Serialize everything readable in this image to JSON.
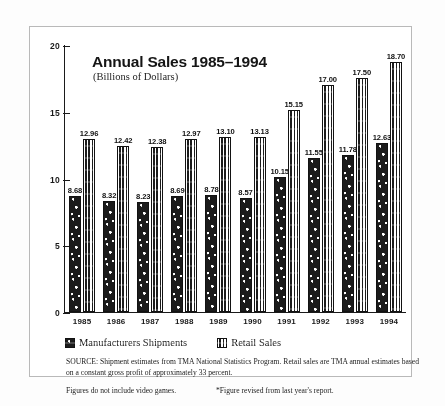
{
  "chart_data": {
    "type": "bar",
    "title": "Annual Sales 1985–1994",
    "subtitle": "(Billions of Dollars)",
    "xlabel": "",
    "ylabel": "",
    "ylim": [
      0,
      20
    ],
    "yticks": [
      "0",
      "5",
      "10",
      "15",
      "20"
    ],
    "grid": false,
    "legend_position": "below-axis",
    "categories": [
      "1985",
      "1986",
      "1987",
      "1988",
      "1989",
      "1990",
      "1991",
      "1992",
      "1993",
      "1994"
    ],
    "series": [
      {
        "name": "Manufacturers Shipments",
        "pattern": "speckled-dark",
        "values": [
          8.68,
          8.32,
          8.23,
          8.69,
          8.78,
          8.57,
          10.15,
          11.55,
          11.78,
          12.63
        ],
        "labels": [
          "8.68",
          "8.32",
          "8.23",
          "8.69",
          "8.78",
          "8.57",
          "10.15",
          "11.55",
          "11.78",
          "12.63"
        ]
      },
      {
        "name": "Retail Sales",
        "pattern": "wavy-stripes",
        "values": [
          12.96,
          12.42,
          12.38,
          12.97,
          13.1,
          13.13,
          15.15,
          17.0,
          17.5,
          18.7
        ],
        "labels": [
          "12.96",
          "12.42",
          "12.38",
          "12.97",
          "13.10",
          "13.13",
          "15.15",
          "17.00",
          "17.50",
          "18.70"
        ]
      }
    ]
  },
  "legend": {
    "items": [
      {
        "label": "Manufacturers Shipments"
      },
      {
        "label": "Retail Sales"
      }
    ]
  },
  "notes": {
    "source": "SOURCE:  Shipment estimates from TMA National Statistics Program.  Retail sales are TMA annual estimates based on a constant gross profit of approximately 33 percent.",
    "footnote_left": "Figures do not include video games.",
    "footnote_right": "*Figure revised from last year's report."
  },
  "colors": {
    "ink": "#1b1b1b",
    "frame": "#b9b9b9",
    "background": "#ffffff"
  }
}
